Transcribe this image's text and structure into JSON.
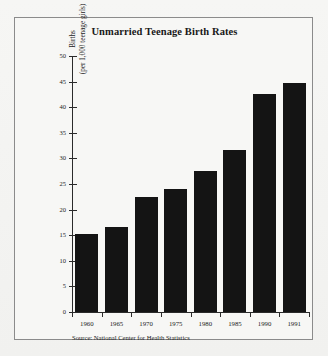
{
  "chart_data": {
    "type": "bar",
    "title": "Unmarried Teenage Birth Rates",
    "xlabel": "",
    "ylabel_line1": "Births",
    "ylabel_line2": "(per 1,000 teenage girls)",
    "categories": [
      "1960",
      "1965",
      "1970",
      "1975",
      "1980",
      "1985",
      "1990",
      "1991"
    ],
    "values": [
      15.3,
      16.7,
      22.5,
      24.0,
      27.6,
      31.6,
      42.5,
      44.8
    ],
    "ylim": [
      0,
      50
    ],
    "ytick_values": [
      0,
      5,
      10,
      15,
      20,
      25,
      30,
      35,
      40,
      45,
      50
    ],
    "ytick_labels": [
      "0",
      "5",
      "10",
      "15",
      "20",
      "25",
      "30",
      "35",
      "40",
      "45",
      "50"
    ],
    "grid": false,
    "legend": false,
    "bar_color": "#141414",
    "source_note": "Source: National Center for Health Statistics"
  },
  "figure": {
    "background_color": "#f4f4f2",
    "frame_color": "#8b8b8b",
    "axis_color": "#2b2b2b"
  }
}
